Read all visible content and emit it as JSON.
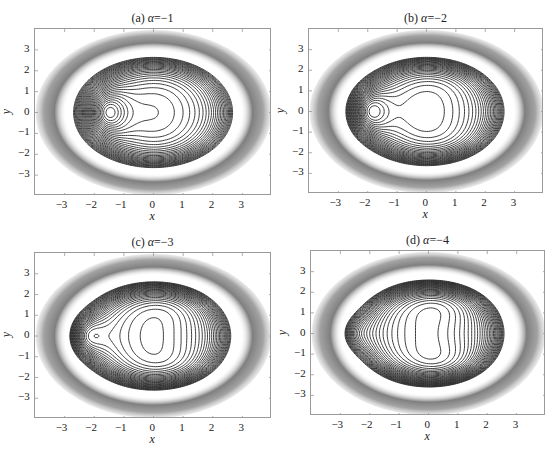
{
  "figure": {
    "panels": [
      {
        "id": "a",
        "title_prefix": "(a) ",
        "title_symbol": "α",
        "title_value": "=−1",
        "alpha": -1,
        "box": {
          "left": 34,
          "top": 28,
          "width": 237,
          "height": 167
        }
      },
      {
        "id": "b",
        "title_prefix": "(b) ",
        "title_symbol": "α",
        "title_value": "=−2",
        "alpha": -2,
        "box": {
          "left": 308,
          "top": 28,
          "width": 235,
          "height": 165
        }
      },
      {
        "id": "c",
        "title_prefix": "(c) ",
        "title_symbol": "α",
        "title_value": "=−3",
        "alpha": -3,
        "box": {
          "left": 34,
          "top": 252,
          "width": 237,
          "height": 166
        }
      },
      {
        "id": "d",
        "title_prefix": "(d) ",
        "title_symbol": "α",
        "title_value": "=−4",
        "alpha": -4,
        "box": {
          "left": 310,
          "top": 250,
          "width": 235,
          "height": 165
        }
      }
    ],
    "xlabel": "x",
    "ylabel": "y",
    "xticks": [
      "−3",
      "−2",
      "−1",
      "0",
      "1",
      "2",
      "3"
    ],
    "yticks": [
      "3",
      "2",
      "1",
      "0",
      "−1",
      "−2",
      "−3"
    ]
  },
  "chart_data": [
    {
      "type": "contour",
      "title": "(a) α=−1",
      "alpha": -1,
      "xlabel": "x",
      "ylabel": "y",
      "xlim": [
        -4,
        4
      ],
      "ylim": [
        -4,
        4
      ],
      "xticks": [
        -3,
        -2,
        -1,
        0,
        1,
        2,
        3
      ],
      "yticks": [
        -3,
        -2,
        -1,
        0,
        1,
        2,
        3
      ],
      "description": "Elliptical contours with dense gray outer band; interior closed loop centered near x≈-1.5 and wavy S-shaped contours around x≈0 to 1"
    },
    {
      "type": "contour",
      "title": "(b) α=−2",
      "alpha": -2,
      "xlabel": "x",
      "ylabel": "y",
      "xlim": [
        -4,
        4
      ],
      "ylim": [
        -4,
        4
      ],
      "xticks": [
        -3,
        -2,
        -1,
        0,
        1,
        2,
        3
      ],
      "yticks": [
        -3,
        -2,
        -1,
        0,
        1,
        2,
        3
      ],
      "description": "Closed loop near x≈-2, crescent-shaped contours, small closed ellipse centered near (0.5, 0)"
    },
    {
      "type": "contour",
      "title": "(c) α=−3",
      "alpha": -3,
      "xlabel": "x",
      "ylabel": "y",
      "xlim": [
        -4,
        4
      ],
      "ylim": [
        -4,
        4
      ],
      "xticks": [
        -3,
        -2,
        -1,
        0,
        1,
        2,
        3
      ],
      "yticks": [
        -3,
        -2,
        -1,
        0,
        1,
        2,
        3
      ],
      "description": "Crescent loop near x≈-2.5, concentric ellipses around (0.3, 0), chevron contours on top and bottom"
    },
    {
      "type": "contour",
      "title": "(d) α=−4",
      "alpha": -4,
      "xlabel": "x",
      "ylabel": "y",
      "xlim": [
        -4,
        4
      ],
      "ylim": [
        -4,
        4
      ],
      "xticks": [
        -3,
        -2,
        -1,
        0,
        1,
        2,
        3
      ],
      "yticks": [
        -3,
        -2,
        -1,
        0,
        1,
        2,
        3
      ],
      "description": "Thin crescent loop near x≈-3, dense concentric ellipses around (0.2, 0), many chevron contours top and bottom"
    }
  ]
}
